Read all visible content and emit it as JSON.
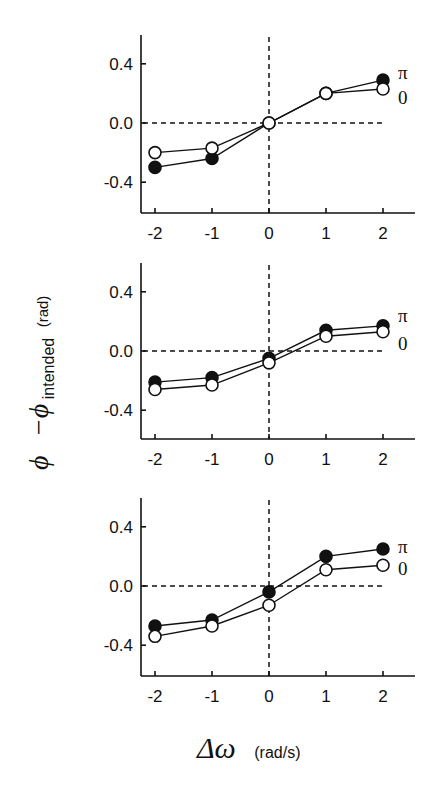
{
  "chart_data": [
    {
      "type": "line",
      "panel": "top",
      "x": [
        -2,
        -1,
        0,
        1,
        2
      ],
      "series": [
        {
          "name": "π",
          "marker": "filled",
          "values": [
            -0.3,
            -0.24,
            0.0,
            0.2,
            0.29
          ]
        },
        {
          "name": "0",
          "marker": "open",
          "values": [
            -0.2,
            -0.17,
            0.0,
            0.2,
            0.23
          ]
        }
      ],
      "xticks": [
        "-2",
        "-1",
        "0",
        "1",
        "2"
      ],
      "yticks": [
        "0.4",
        "0.0",
        "-0.4"
      ],
      "ylim": [
        -0.6,
        0.6
      ],
      "xlim": [
        -2.25,
        2.5
      ],
      "reference_lines": {
        "horizontal": 0.0,
        "vertical": 0.0,
        "style": "dashed"
      },
      "legend": [
        "π",
        "0"
      ],
      "legend_position": "right, inline at line ends"
    },
    {
      "type": "line",
      "panel": "middle",
      "x": [
        -2,
        -1,
        0,
        1,
        2
      ],
      "series": [
        {
          "name": "π",
          "marker": "filled",
          "values": [
            -0.21,
            -0.18,
            -0.05,
            0.14,
            0.17
          ]
        },
        {
          "name": "0",
          "marker": "open",
          "values": [
            -0.26,
            -0.23,
            -0.08,
            0.1,
            0.13
          ]
        }
      ],
      "xticks": [
        "-2",
        "-1",
        "0",
        "1",
        "2"
      ],
      "yticks": [
        "0.4",
        "0.0",
        "-0.4"
      ],
      "ylim": [
        -0.6,
        0.6
      ],
      "xlim": [
        -2.25,
        2.5
      ],
      "reference_lines": {
        "horizontal": 0.0,
        "vertical": 0.0,
        "style": "dashed"
      },
      "legend": [
        "π",
        "0"
      ],
      "legend_position": "right, inline at line ends"
    },
    {
      "type": "line",
      "panel": "bottom",
      "x": [
        -2,
        -1,
        0,
        1,
        2
      ],
      "series": [
        {
          "name": "π",
          "marker": "filled",
          "values": [
            -0.27,
            -0.23,
            -0.04,
            0.2,
            0.25
          ]
        },
        {
          "name": "0",
          "marker": "open",
          "values": [
            -0.34,
            -0.27,
            -0.13,
            0.11,
            0.14
          ]
        }
      ],
      "xticks": [
        "-2",
        "-1",
        "0",
        "1",
        "2"
      ],
      "yticks": [
        "0.4",
        "0.0",
        "-0.4"
      ],
      "ylim": [
        -0.6,
        0.6
      ],
      "xlim": [
        -2.25,
        2.5
      ],
      "reference_lines": {
        "horizontal": 0.0,
        "vertical": 0.0,
        "style": "dashed"
      },
      "legend": [
        "π",
        "0"
      ],
      "legend_position": "right, inline at line ends"
    }
  ],
  "labels": {
    "xlabel_symbol": "Δω",
    "xlabel_unit": "(rad/s)",
    "ylabel_phi": "ϕ",
    "ylabel_minus": "−ϕ",
    "ylabel_sub": "intended",
    "ylabel_unit": "(rad)"
  },
  "colors": {
    "ink": "#111111",
    "background": "#ffffff",
    "open_marker_fill": "#ffffff"
  }
}
